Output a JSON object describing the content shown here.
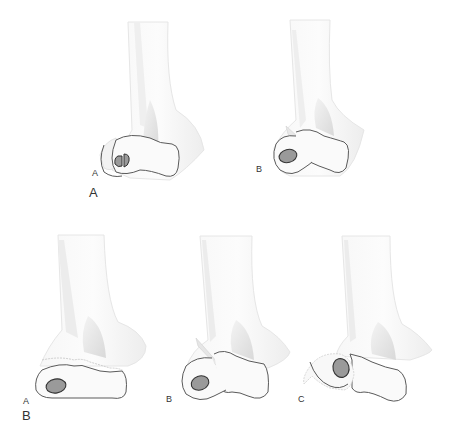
{
  "figure": {
    "panels": [
      {
        "id": "panel-a",
        "label": "A",
        "subfigures": [
          {
            "id": "a-a",
            "label": "A",
            "description": "capitellum fragment with split ossified nucleus"
          },
          {
            "id": "a-b",
            "label": "B",
            "description": "lateral condyle fragment with fracture line through trochlea"
          }
        ]
      },
      {
        "id": "panel-b",
        "label": "B",
        "subfigures": [
          {
            "id": "b-a",
            "label": "A",
            "description": "transverse physeal fracture across distal humerus"
          },
          {
            "id": "b-b",
            "label": "B",
            "description": "oblique fracture with separated lateral fragment"
          },
          {
            "id": "b-c",
            "label": "C",
            "description": "displaced and rotated lateral fragment"
          }
        ]
      }
    ],
    "colors": {
      "bone_fill": "#f4f4f4",
      "bone_shade": "#e2e2e2",
      "outline": "#555555",
      "nucleus": "#9a9a9a",
      "label": "#333333"
    }
  }
}
